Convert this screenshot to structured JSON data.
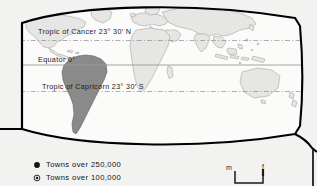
{
  "figure": {
    "type": "world-map",
    "projection_note": "oval world projection, left edge straight",
    "background_color": "#f2f2f0",
    "frame_color": "#000000",
    "land_fill_color": "#e4e4e2",
    "land_outline_color": "#9a9a9a",
    "highlight_region": "South America",
    "highlight_fill_color": "#8a8a8a",
    "highlight_outline_color": "#5a5a5a"
  },
  "latitude_lines": [
    {
      "id": "tropic-of-cancer",
      "label": "Tropic of Cancer 23° 30′ N",
      "style": "dash-dot",
      "color": "#8c8c8c"
    },
    {
      "id": "equator",
      "label": "Equator 0°",
      "style": "solid",
      "color": "#9a9a9a"
    },
    {
      "id": "tropic-of-capricorn",
      "label": "Tropic of Capricorn 23° 30′ S",
      "style": "dash-dot",
      "color": "#8c8c8c"
    }
  ],
  "legend": {
    "items": [
      {
        "marker": "filled-circle",
        "label": "Towns over 250,000"
      },
      {
        "marker": "circled-dot",
        "label": "Towns over 100,000"
      }
    ]
  },
  "scale_bar": {
    "left_unit": "m",
    "right_unit": "f"
  }
}
